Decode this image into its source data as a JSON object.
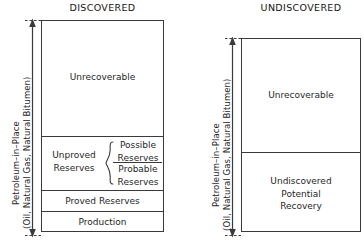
{
  "diagram": {
    "type": "petroleum-resource-classification",
    "panels": [
      {
        "id": "discovered",
        "title": "DISCOVERED",
        "axis_label_line1": "Petroleum–in–Place",
        "axis_label_line2": "(Oil, Natural Gas, Natural Bitumen)",
        "segments": [
          {
            "id": "unrecoverable",
            "label": "Unrecoverable"
          },
          {
            "id": "unproved-reserves",
            "label": "Unproved\nReserves",
            "sublabels": [
              {
                "id": "possible-reserves",
                "label": "Possible\nReserves"
              },
              {
                "id": "probable-reserves",
                "label": "Probable\nReserves"
              }
            ],
            "bracket": "curly-brace"
          },
          {
            "id": "proved-reserves",
            "label": "Proved Reserves"
          },
          {
            "id": "production",
            "label": "Production"
          }
        ]
      },
      {
        "id": "undiscovered",
        "title": "UNDISCOVERED",
        "axis_label_line1": "Petroleum–in–Place",
        "axis_label_line2": "(Oil, Natural Gas, Natural Bitumen)",
        "segments": [
          {
            "id": "unrecoverable",
            "label": "Unrecoverable"
          },
          {
            "id": "undiscovered-potential-recovery",
            "label": "Undiscovered\nPotential\nRecovery"
          }
        ]
      }
    ]
  },
  "labels": {
    "title_discovered": "DISCOVERED",
    "title_undiscovered": "UNDISCOVERED",
    "unrecoverable": "Unrecoverable",
    "unproved_line1": "Unproved",
    "unproved_line2": "Reserves",
    "possible_line1": "Possible",
    "possible_line2": "Reserves",
    "probable_line1": "Probable",
    "probable_line2": "Reserves",
    "proved_reserves": "Proved Reserves",
    "production": "Production",
    "undisc_line1": "Undiscovered",
    "undisc_line2": "Potential",
    "undisc_line3": "Recovery",
    "axis_line1": "Petroleum–in–Place",
    "axis_line2": "(Oil, Natural Gas, Natural Bitumen)"
  },
  "colors": {
    "stroke": "#3a3a3a",
    "text": "#1f1f1f",
    "background": "#ffffff"
  }
}
